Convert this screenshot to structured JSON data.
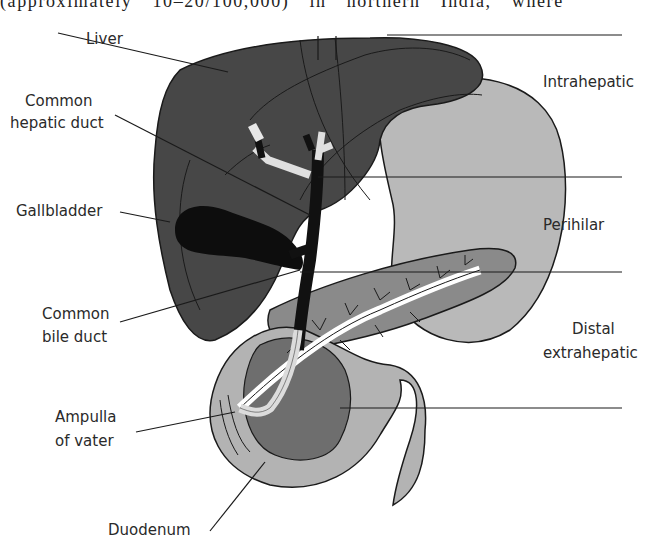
{
  "caption_fragment": "(approximately 10–20/100,000) in northern India, where",
  "figure": {
    "colors": {
      "liver": "#474747",
      "gallbladder": "#0d0d0d",
      "ducts_dark": "#111111",
      "ducts_light": "#e8e8e8",
      "stomach": "#b9b9b9",
      "pancreas": "#8a8a8a",
      "duodenum": "#b3b3b3",
      "pancreatic_head": "#6e6e6e",
      "line": "#1a1a1a"
    },
    "left_labels": {
      "liver": "Liver",
      "common_hepatic_duct_1": "Common",
      "common_hepatic_duct_2": "hepatic duct",
      "gallbladder": "Gallbladder",
      "common_bile_duct_1": "Common",
      "common_bile_duct_2": "bile duct",
      "ampulla_1": "Ampulla",
      "ampulla_2": "of vater",
      "duodenum": "Duodenum"
    },
    "region_labels": {
      "intrahepatic": "Intrahepatic",
      "perihilar": "Perihilar",
      "distal_1": "Distal",
      "distal_2": "extrahepatic"
    }
  }
}
